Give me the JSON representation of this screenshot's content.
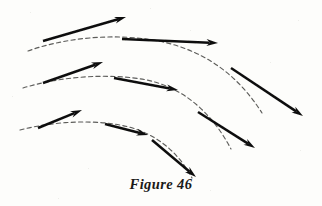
{
  "figure": {
    "caption": "Figure 46",
    "background_color": "#fdfdfb",
    "ink_color": "#111110",
    "dash_color": "#3a3a38",
    "width": 322,
    "height": 206
  },
  "chart_data": {
    "type": "line",
    "title": "Figure 46",
    "subtitle": "",
    "xlabel": "",
    "ylabel": "",
    "grid": false,
    "legend": "none",
    "xlim": [
      0,
      322
    ],
    "ylim": [
      0,
      206
    ],
    "series": [
      {
        "name": "trajectory-1",
        "style": "dashed",
        "path": "M 28 51 C 70 36, 122 33, 163 42 C 208 52, 240 78, 262 113",
        "vectors": [
          {
            "name": "vector-1-1",
            "x1": 43,
            "y1": 41,
            "x2": 126,
            "y2": 17
          },
          {
            "name": "vector-1-2",
            "x1": 122,
            "y1": 39,
            "x2": 218,
            "y2": 43
          },
          {
            "name": "vector-1-3",
            "x1": 231,
            "y1": 68,
            "x2": 303,
            "y2": 116
          }
        ]
      },
      {
        "name": "trajectory-2",
        "style": "dashed",
        "path": "M 23 88 C 62 76, 110 73, 147 80 C 184 88, 212 113, 231 149",
        "vectors": [
          {
            "name": "vector-2-1",
            "x1": 43,
            "y1": 83,
            "x2": 103,
            "y2": 62
          },
          {
            "name": "vector-2-2",
            "x1": 114,
            "y1": 78,
            "x2": 178,
            "y2": 90
          },
          {
            "name": "vector-2-3",
            "x1": 198,
            "y1": 112,
            "x2": 255,
            "y2": 148
          }
        ]
      },
      {
        "name": "trajectory-3",
        "style": "dashed",
        "path": "M 20 130 C 54 121, 98 119, 129 127 C 159 135, 180 155, 192 178",
        "vectors": [
          {
            "name": "vector-3-1",
            "x1": 38,
            "y1": 128,
            "x2": 82,
            "y2": 110
          },
          {
            "name": "vector-3-2",
            "x1": 105,
            "y1": 124,
            "x2": 148,
            "y2": 135
          },
          {
            "name": "vector-3-3",
            "x1": 152,
            "y1": 140,
            "x2": 196,
            "y2": 177
          }
        ]
      }
    ]
  }
}
